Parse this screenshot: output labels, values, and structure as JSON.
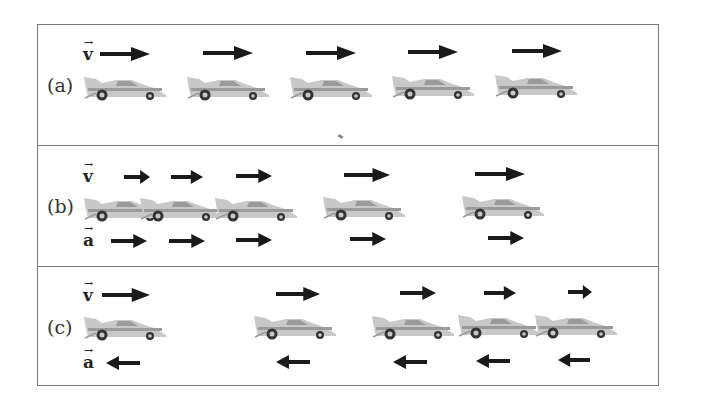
{
  "figure": {
    "colors": {
      "arrow": "#1a1a1a",
      "border": "#777777",
      "car_body": "#c8c8c8",
      "car_shade": "#9a9a9a",
      "wheel": "#333333"
    },
    "vector_labels": {
      "velocity": "v",
      "acceleration": "a",
      "vector_mark": "→"
    },
    "panels": [
      {
        "id": "a",
        "label": "(a)",
        "description": "constant velocity, zero acceleration",
        "velocity_arrows": [
          {
            "x": 62,
            "y": 22,
            "w": 50,
            "dir": "right"
          },
          {
            "x": 165,
            "y": 21,
            "w": 50,
            "dir": "right"
          },
          {
            "x": 268,
            "y": 21,
            "w": 50,
            "dir": "right"
          },
          {
            "x": 370,
            "y": 20,
            "w": 50,
            "dir": "right"
          },
          {
            "x": 474,
            "y": 19,
            "w": 50,
            "dir": "right"
          }
        ],
        "cars": [
          {
            "x": 44,
            "y": 46
          },
          {
            "x": 147,
            "y": 46
          },
          {
            "x": 250,
            "y": 46
          },
          {
            "x": 352,
            "y": 45
          },
          {
            "x": 455,
            "y": 44
          }
        ],
        "acceleration_arrows": []
      },
      {
        "id": "b",
        "label": "(b)",
        "description": "velocity and acceleration same direction, speeding up",
        "velocity_arrows": [
          {
            "x": 86,
            "y": 24,
            "w": 26,
            "dir": "right"
          },
          {
            "x": 133,
            "y": 24,
            "w": 32,
            "dir": "right"
          },
          {
            "x": 198,
            "y": 23,
            "w": 36,
            "dir": "right"
          },
          {
            "x": 306,
            "y": 22,
            "w": 46,
            "dir": "right"
          },
          {
            "x": 437,
            "y": 21,
            "w": 50,
            "dir": "right"
          }
        ],
        "cars": [
          {
            "x": 44,
            "y": 46
          },
          {
            "x": 100,
            "y": 46
          },
          {
            "x": 175,
            "y": 46
          },
          {
            "x": 283,
            "y": 45
          },
          {
            "x": 422,
            "y": 44
          }
        ],
        "acceleration_arrows": [
          {
            "x": 73,
            "y": 88,
            "w": 36,
            "dir": "right"
          },
          {
            "x": 131,
            "y": 88,
            "w": 36,
            "dir": "right"
          },
          {
            "x": 198,
            "y": 87,
            "w": 36,
            "dir": "right"
          },
          {
            "x": 312,
            "y": 86,
            "w": 36,
            "dir": "right"
          },
          {
            "x": 450,
            "y": 85,
            "w": 36,
            "dir": "right"
          }
        ]
      },
      {
        "id": "c",
        "label": "(c)",
        "description": "velocity and acceleration opposite, slowing down",
        "velocity_arrows": [
          {
            "x": 64,
            "y": 21,
            "w": 48,
            "dir": "right"
          },
          {
            "x": 238,
            "y": 20,
            "w": 44,
            "dir": "right"
          },
          {
            "x": 362,
            "y": 19,
            "w": 36,
            "dir": "right"
          },
          {
            "x": 446,
            "y": 19,
            "w": 32,
            "dir": "right"
          },
          {
            "x": 530,
            "y": 18,
            "w": 24,
            "dir": "right"
          }
        ],
        "cars": [
          {
            "x": 44,
            "y": 44
          },
          {
            "x": 214,
            "y": 43
          },
          {
            "x": 332,
            "y": 43
          },
          {
            "x": 418,
            "y": 42
          },
          {
            "x": 495,
            "y": 42
          }
        ],
        "acceleration_arrows": [
          {
            "x": 68,
            "y": 89,
            "w": 34,
            "dir": "left"
          },
          {
            "x": 238,
            "y": 88,
            "w": 34,
            "dir": "left"
          },
          {
            "x": 355,
            "y": 88,
            "w": 34,
            "dir": "left"
          },
          {
            "x": 438,
            "y": 87,
            "w": 34,
            "dir": "left"
          },
          {
            "x": 520,
            "y": 86,
            "w": 32,
            "dir": "left"
          }
        ]
      }
    ]
  }
}
